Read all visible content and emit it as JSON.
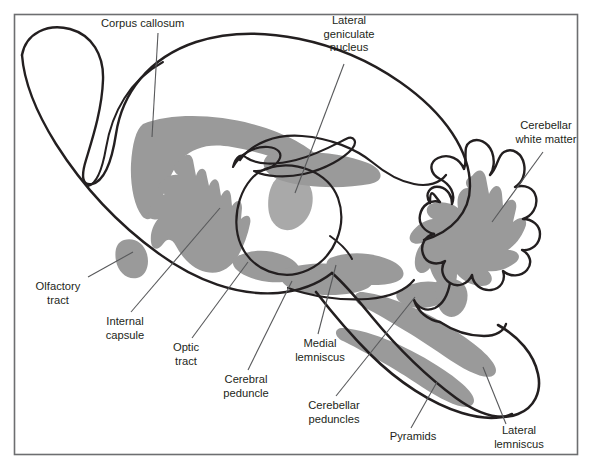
{
  "figure": {
    "type": "anatomical-diagram",
    "frame": {
      "x": 14,
      "y": 14,
      "width": 564,
      "height": 441,
      "border_color": "#58595b",
      "background": "#ffffff"
    },
    "colors": {
      "outline": "#231f20",
      "white_matter_gray": "#9a9a9a",
      "leader_line": "#58595b",
      "text": "#231f20",
      "frame_border": "#6d6e70"
    }
  },
  "labels": [
    {
      "id": "corpus-callosum",
      "lines": [
        "Corpus callosum"
      ],
      "text_x": 101,
      "text_y": 27,
      "anchor": "start",
      "leader": {
        "x1": 158,
        "y1": 33,
        "x2": 152,
        "y2": 137
      }
    },
    {
      "id": "lateral-geniculate-nucleus",
      "lines": [
        "Lateral",
        "geniculate",
        "nucleus"
      ],
      "text_x": 349,
      "text_y": 24,
      "anchor": "middle",
      "leader": {
        "x1": 344,
        "y1": 64,
        "x2": 295,
        "y2": 193
      }
    },
    {
      "id": "cerebellar-white-matter",
      "lines": [
        "Cerebellar",
        "white matter"
      ],
      "text_x": 546,
      "text_y": 129,
      "anchor": "middle",
      "leader": {
        "x1": 543,
        "y1": 152,
        "x2": 492,
        "y2": 222
      }
    },
    {
      "id": "olfactory-tract",
      "lines": [
        "Olfactory",
        "tract"
      ],
      "text_x": 58,
      "text_y": 290,
      "anchor": "middle",
      "leader": {
        "x1": 88,
        "y1": 277,
        "x2": 133,
        "y2": 252
      }
    },
    {
      "id": "internal-capsule",
      "lines": [
        "Internal",
        "capsule"
      ],
      "text_x": 125,
      "text_y": 325,
      "anchor": "middle",
      "leader": {
        "x1": 131,
        "y1": 312,
        "x2": 220,
        "y2": 208
      }
    },
    {
      "id": "optic-tract",
      "lines": [
        "Optic",
        "tract"
      ],
      "text_x": 186,
      "text_y": 351,
      "anchor": "middle",
      "leader": {
        "x1": 192,
        "y1": 338,
        "x2": 248,
        "y2": 262
      }
    },
    {
      "id": "cerebral-peduncle",
      "lines": [
        "Cerebral",
        "peduncle"
      ],
      "text_x": 246,
      "text_y": 383,
      "anchor": "middle",
      "leader": {
        "x1": 248,
        "y1": 370,
        "x2": 292,
        "y2": 281
      }
    },
    {
      "id": "medial-lemniscus",
      "lines": [
        "Medial",
        "lemniscus"
      ],
      "text_x": 320,
      "text_y": 347,
      "anchor": "middle",
      "leader": {
        "x1": 318,
        "y1": 334,
        "x2": 336,
        "y2": 265
      }
    },
    {
      "id": "cerebellar-peduncles",
      "lines": [
        "Cerebellar",
        "peduncles"
      ],
      "text_x": 334,
      "text_y": 409,
      "anchor": "middle",
      "leader": {
        "x1": 336,
        "y1": 396,
        "x2": 415,
        "y2": 297
      }
    },
    {
      "id": "pyramids",
      "lines": [
        "Pyramids"
      ],
      "text_x": 413,
      "text_y": 440,
      "anchor": "middle",
      "leader": {
        "x1": 411,
        "y1": 428,
        "x2": 437,
        "y2": 382
      }
    },
    {
      "id": "lateral-lemniscus",
      "lines": [
        "Lateral",
        "lemniscus"
      ],
      "text_x": 519,
      "text_y": 434,
      "anchor": "middle",
      "leader": {
        "x1": 506,
        "y1": 424,
        "x2": 483,
        "y2": 367
      }
    }
  ],
  "structures": {
    "gray_regions": [
      "corpus-callosum-band",
      "internal-capsule-fan",
      "thalamus-lgn",
      "optic-tract",
      "cerebral-peduncle",
      "medial-lemniscus",
      "cerebellar-white-matter",
      "cerebellar-peduncles",
      "pyramids",
      "lateral-lemniscus",
      "olfactory-tract-bulb"
    ],
    "outlines": [
      "cerebral-hemisphere-outline",
      "olfactory-bulb-loop",
      "ventricle-fornix-outline",
      "thalamus-ring-outline",
      "cerebellum-folia-outline",
      "brainstem-medulla-outline"
    ]
  }
}
